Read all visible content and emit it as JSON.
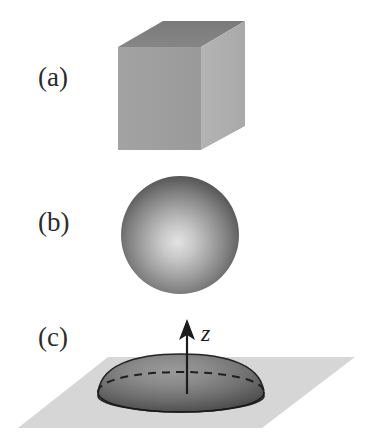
{
  "figure": {
    "title": "",
    "background_color": "#ffffff",
    "width": 369,
    "height": 444
  },
  "panels": [
    {
      "id": "a",
      "label": "(a)",
      "shape": "cube",
      "description": "shaded isometric cube",
      "colors": {
        "top_face": "#7d7d7d",
        "front_face": "#9e9e9e",
        "right_face": "#b0b0b0"
      }
    },
    {
      "id": "b",
      "label": "(b)",
      "shape": "sphere",
      "description": "radially shaded sphere",
      "colors": {
        "highlight": "#dcdcdc",
        "midtone": "#8f8f8f",
        "edge": "#4a4a4a"
      }
    },
    {
      "id": "c",
      "label": "(c)",
      "shape": "spherical-cap-on-plane",
      "description": "flattened dome resting on a plane with vertical axis arrow",
      "colors": {
        "plane": "#d5d5d5",
        "dome_highlight": "#8a8a8a",
        "dome_edge": "#3f3f3f",
        "outline": "#1c1c1c"
      },
      "axis": {
        "label": "z",
        "direction": "up",
        "arrow_color": "#1c1c1c"
      },
      "hidden_rim_style": "dashed"
    }
  ],
  "annotations": {
    "axis_label_z": "z"
  }
}
